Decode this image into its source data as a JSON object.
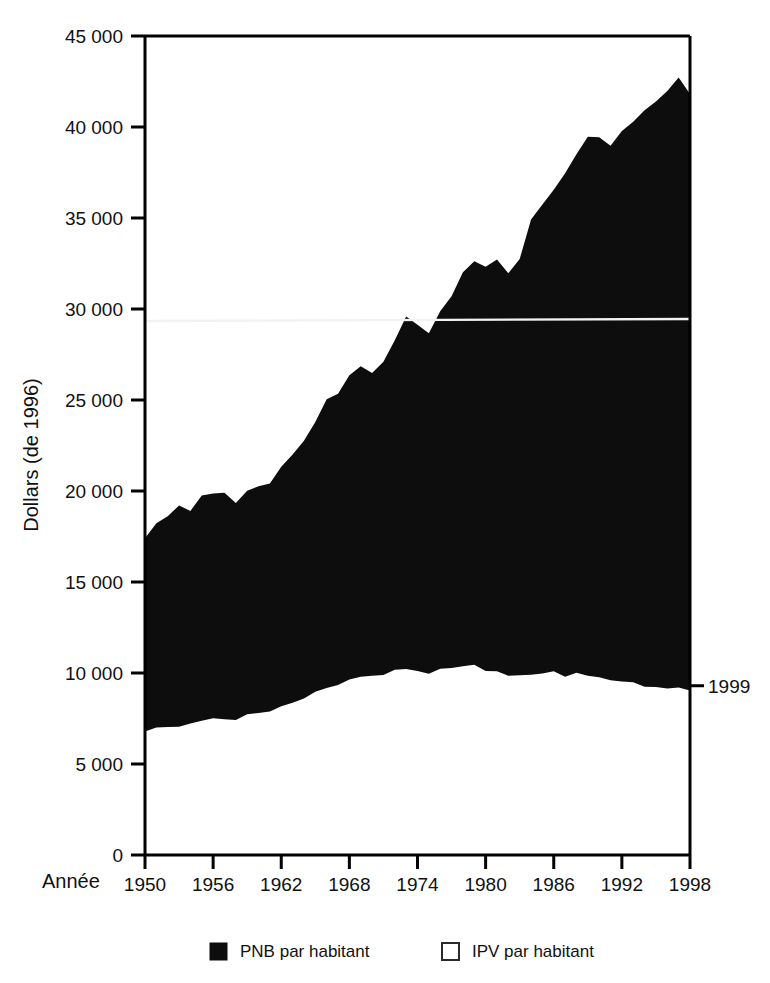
{
  "figure": {
    "background_color": "#ffffff",
    "ink_color": "#0d0d0d"
  },
  "axes": {
    "y_title": "Dollars (de 1996)",
    "x_title": "Année",
    "y_ticks": [
      "0",
      "5 000",
      "10 000",
      "15 000",
      "20 000",
      "25 000",
      "30 000",
      "35 000",
      "40 000",
      "45 000"
    ],
    "x_ticks": [
      "1950",
      "1956",
      "1962",
      "1968",
      "1974",
      "1980",
      "1986",
      "1992",
      "1998"
    ]
  },
  "annotations": [
    {
      "name": "year-marker-1999",
      "text": "1999",
      "value": 9300
    }
  ],
  "legend": {
    "entries": [
      {
        "label": "PNB par habitant",
        "swatch": "filled",
        "color": "#0d0d0d"
      },
      {
        "label": "IPV par habitant",
        "swatch": "open",
        "color": "#ffffff"
      }
    ]
  },
  "chart_data": {
    "type": "area",
    "title": "",
    "subtitle": "",
    "xlabel": "Année",
    "ylabel": "Dollars (de 1996)",
    "xlim": [
      1950,
      1998
    ],
    "ylim": [
      0,
      45000
    ],
    "grid": false,
    "legend_position": "bottom",
    "x": [
      1950,
      1951,
      1952,
      1953,
      1954,
      1955,
      1956,
      1957,
      1958,
      1959,
      1960,
      1961,
      1962,
      1963,
      1964,
      1965,
      1966,
      1967,
      1968,
      1969,
      1970,
      1971,
      1972,
      1973,
      1974,
      1975,
      1976,
      1977,
      1978,
      1979,
      1980,
      1981,
      1982,
      1983,
      1984,
      1985,
      1986,
      1987,
      1988,
      1989,
      1990,
      1991,
      1992,
      1993,
      1994,
      1995,
      1996,
      1997,
      1998
    ],
    "series": [
      {
        "name": "PNB par habitant",
        "values": [
          17500,
          18200,
          18600,
          19300,
          18900,
          19700,
          19900,
          19800,
          19300,
          20100,
          20300,
          20500,
          21300,
          21900,
          22700,
          23800,
          25000,
          25300,
          26300,
          26800,
          26500,
          27000,
          28200,
          29500,
          29100,
          28600,
          29800,
          30800,
          32000,
          32700,
          32300,
          32800,
          31900,
          32800,
          34800,
          35700,
          36500,
          37400,
          38600,
          39400,
          39500,
          38900,
          39700,
          40300,
          41000,
          41300,
          41900,
          42600,
          41800
        ]
      },
      {
        "name": "IPV par habitant",
        "values": [
          6700,
          6900,
          7000,
          7150,
          7200,
          7400,
          7500,
          7550,
          7500,
          7700,
          7800,
          7900,
          8100,
          8300,
          8600,
          8900,
          9200,
          9400,
          9700,
          9850,
          9900,
          9850,
          10100,
          10300,
          10200,
          10000,
          10200,
          10300,
          10450,
          10400,
          10100,
          10000,
          9800,
          9850,
          10000,
          9950,
          10050,
          9900,
          9950,
          9850,
          9700,
          9550,
          9500,
          9400,
          9300,
          9200,
          9150,
          9100,
          9000
        ]
      }
    ],
    "fill_between": {
      "upper": "PNB par habitant",
      "lower": "IPV par habitant",
      "color": "#0d0d0d"
    }
  }
}
